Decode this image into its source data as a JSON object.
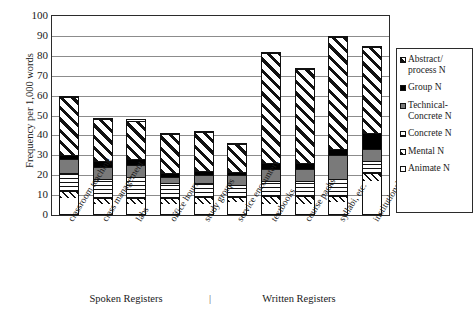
{
  "chart_data": {
    "type": "bar",
    "subtype": "stacked-bar",
    "title": "",
    "xlabel": "",
    "ylabel": "Frequency per 1,000 words",
    "ylim": [
      0,
      100
    ],
    "yticks": [
      0,
      10,
      20,
      30,
      40,
      50,
      60,
      70,
      80,
      90,
      100
    ],
    "grid": true,
    "legend_position": "right",
    "categories": [
      "classroom teaching",
      "class management",
      "labs",
      "office hours",
      "study groups",
      "service encounters",
      "textbooks",
      "course packs",
      "syllabi, etc.",
      "institutional writing"
    ],
    "series": [
      {
        "name": "Animate N",
        "pattern": "open-white",
        "values": [
          8,
          5,
          5,
          5,
          5,
          6,
          5,
          5,
          6,
          17
        ]
      },
      {
        "name": "Mental N",
        "pattern": "diagonal-fine",
        "values": [
          4,
          3,
          3,
          3,
          4,
          3,
          4,
          4,
          3,
          4
        ]
      },
      {
        "name": "Concrete N",
        "pattern": "horizontal-lines",
        "values": [
          9,
          10,
          11,
          8,
          7,
          6,
          8,
          8,
          9,
          6
        ]
      },
      {
        "name": "Technical-Concrete N",
        "pattern": "solid-gray",
        "values": [
          7,
          6,
          6,
          3,
          4,
          5,
          6,
          6,
          12,
          6
        ]
      },
      {
        "name": "Group N",
        "pattern": "solid-black",
        "values": [
          2,
          3,
          3,
          2,
          2,
          2,
          3,
          3,
          3,
          8
        ]
      },
      {
        "name": "Abstract/process N",
        "pattern": "diagonal-wide",
        "values": [
          30,
          22,
          20,
          20,
          20,
          14,
          56,
          48,
          57,
          44
        ]
      }
    ],
    "totals": [
      60,
      49,
      48,
      41,
      42,
      36,
      82,
      74,
      90,
      85
    ]
  },
  "legend": {
    "items": [
      {
        "label_line1": "Abstract/",
        "label_line2": "process N"
      },
      {
        "label_line1": "Group N",
        "label_line2": ""
      },
      {
        "label_line1": "Technical-",
        "label_line2": "Concrete N"
      },
      {
        "label_line1": "Concrete N",
        "label_line2": ""
      },
      {
        "label_line1": "Mental N",
        "label_line2": ""
      },
      {
        "label_line1": "Animate N",
        "label_line2": ""
      }
    ]
  },
  "caption": {
    "spoken": "Spoken Registers",
    "divider": "|",
    "written": "Written Registers"
  },
  "colors": {
    "axis": "#2b2b2b",
    "gridline": "#8c8c8c",
    "ink": "#111111",
    "gray_fill": "#7a7a7a",
    "background": "#ffffff"
  }
}
